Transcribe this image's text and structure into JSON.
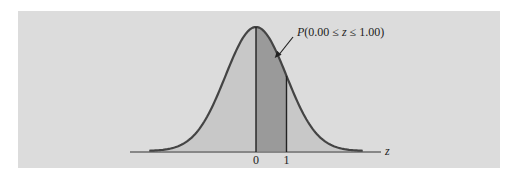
{
  "chart_data": {
    "type": "area",
    "title": "",
    "distribution": "standard normal",
    "mean": 0,
    "sd": 1,
    "x_range": [
      -3.5,
      3.5
    ],
    "shaded_interval": [
      0.0,
      1.0
    ],
    "xlabel": "z",
    "xticks": [
      {
        "value": 0,
        "label": "0"
      },
      {
        "value": 1,
        "label": "1"
      }
    ],
    "annotation": {
      "text": "P(0.00 ≤ z ≤ 1.00)",
      "points_to_z": 0.45
    },
    "colors": {
      "background": "#dcdcdc",
      "curve_fill": "#c8c8c8",
      "shaded_fill": "#9a9a9a",
      "curve_line": "#444444",
      "axis": "#333333"
    }
  }
}
